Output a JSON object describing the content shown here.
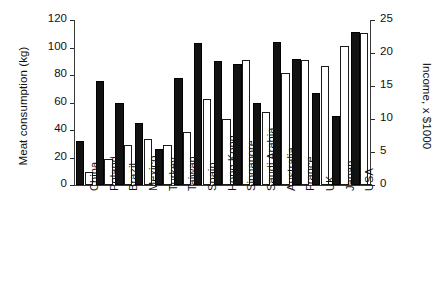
{
  "chart_data": {
    "type": "bar",
    "title": "",
    "subtitle": "",
    "xlabel": "",
    "ylabel": "Meat consumption (kg)",
    "y2label": "Income, x $1000",
    "grid": false,
    "legend": null,
    "legend_position": "none",
    "categories": [
      "China",
      "Poland",
      "Brazil",
      "Mexico",
      "Turkey",
      "Taiwan",
      "Spain",
      "Hong Kong",
      "Singapore",
      "Saudi Arabia",
      "Australia",
      "France",
      "UK",
      "Japan",
      "USA"
    ],
    "ylim": [
      0,
      120
    ],
    "yticks": [
      0,
      20,
      40,
      60,
      80,
      100,
      120
    ],
    "y2lim": [
      0,
      25
    ],
    "y2ticks": [
      0,
      5,
      10,
      15,
      20,
      25
    ],
    "series": [
      {
        "name": "Meat consumption",
        "axis": "left",
        "fill": "#121212",
        "style": "filled",
        "values": [
          32,
          76,
          60,
          45,
          26,
          78,
          103,
          90,
          88,
          60,
          104,
          92,
          67,
          50,
          111
        ]
      },
      {
        "name": "Income",
        "axis": "right",
        "fill": "#ffffff",
        "style": "open",
        "values": [
          2,
          4,
          6,
          7,
          6,
          8,
          13,
          10,
          19,
          11,
          17,
          19,
          18,
          21,
          23
        ]
      }
    ]
  },
  "axes": {
    "left_title": "Meat consumption (kg)",
    "right_title": "Income, x $1000",
    "left_ticks": [
      "0",
      "20",
      "40",
      "60",
      "80",
      "100",
      "120"
    ],
    "right_ticks": [
      "0",
      "5",
      "10",
      "15",
      "20",
      "25"
    ]
  },
  "colors": {
    "dark_bar": "#121212",
    "light_bar": "#ffffff",
    "axis": "#3a3a3a",
    "text": "#111111",
    "background": "#ffffff"
  }
}
